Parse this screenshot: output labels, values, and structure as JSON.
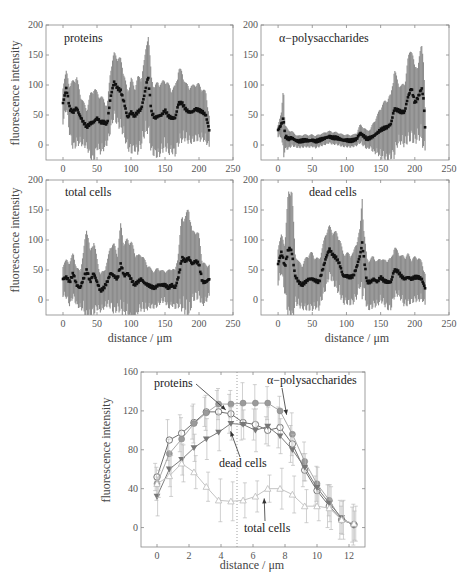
{
  "chart_data": [
    {
      "type": "scatter",
      "panel": "top-left",
      "title": "proteins",
      "xlabel": "",
      "ylabel": "fluorescence intensity",
      "xlim": [
        -25,
        250
      ],
      "ylim": [
        -25,
        200
      ],
      "xticks": [
        0,
        50,
        100,
        150,
        200,
        250
      ],
      "yticks": [
        0,
        50,
        100,
        150,
        200
      ],
      "errorbars": true,
      "x": [
        0,
        5,
        10,
        15,
        20,
        25,
        30,
        35,
        40,
        45,
        50,
        55,
        60,
        65,
        70,
        75,
        80,
        85,
        90,
        95,
        100,
        105,
        110,
        115,
        120,
        125,
        130,
        135,
        140,
        145,
        150,
        155,
        160,
        165,
        170,
        175,
        180,
        185,
        190,
        195,
        200,
        205,
        210,
        215
      ],
      "y": [
        70,
        95,
        60,
        55,
        62,
        48,
        38,
        30,
        36,
        38,
        45,
        38,
        38,
        35,
        80,
        105,
        95,
        90,
        70,
        45,
        55,
        48,
        55,
        60,
        85,
        115,
        55,
        45,
        48,
        50,
        58,
        48,
        45,
        45,
        70,
        70,
        60,
        55,
        55,
        60,
        58,
        55,
        50,
        25
      ],
      "err": [
        30,
        30,
        40,
        55,
        55,
        40,
        35,
        30,
        50,
        60,
        45,
        45,
        40,
        30,
        50,
        50,
        55,
        55,
        50,
        45,
        60,
        50,
        60,
        55,
        60,
        80,
        60,
        55,
        60,
        55,
        55,
        55,
        50,
        55,
        60,
        55,
        45,
        45,
        45,
        45,
        45,
        40,
        40,
        25
      ]
    },
    {
      "type": "scatter",
      "panel": "top-right",
      "title": "α−polysaccharides",
      "xlabel": "",
      "ylabel": "",
      "xlim": [
        -25,
        250
      ],
      "ylim": [
        -25,
        200
      ],
      "xticks": [
        0,
        50,
        100,
        150,
        200,
        250
      ],
      "yticks": [
        0,
        50,
        100,
        150,
        200
      ],
      "errorbars": true,
      "x": [
        0,
        5,
        8,
        10,
        15,
        20,
        25,
        30,
        35,
        40,
        45,
        50,
        55,
        60,
        65,
        70,
        75,
        80,
        85,
        90,
        95,
        100,
        105,
        110,
        115,
        120,
        125,
        130,
        135,
        140,
        145,
        150,
        155,
        160,
        165,
        170,
        175,
        180,
        185,
        190,
        195,
        200,
        205,
        210,
        213,
        215
      ],
      "y": [
        25,
        35,
        45,
        15,
        10,
        12,
        8,
        6,
        7,
        8,
        7,
        8,
        6,
        8,
        10,
        12,
        14,
        12,
        12,
        10,
        8,
        8,
        7,
        8,
        10,
        20,
        15,
        10,
        12,
        15,
        20,
        25,
        28,
        30,
        35,
        60,
        58,
        55,
        55,
        80,
        95,
        70,
        80,
        95,
        75,
        30
      ],
      "err": [
        10,
        20,
        60,
        20,
        15,
        12,
        10,
        10,
        10,
        10,
        10,
        10,
        10,
        10,
        10,
        10,
        10,
        10,
        10,
        10,
        10,
        10,
        10,
        10,
        10,
        15,
        15,
        15,
        15,
        25,
        30,
        40,
        45,
        50,
        50,
        70,
        50,
        45,
        50,
        65,
        75,
        60,
        60,
        75,
        75,
        35
      ]
    },
    {
      "type": "scatter",
      "panel": "middle-left",
      "title": "total cells",
      "xlabel": "distance / μm",
      "ylabel": "fluorescence intensity",
      "xlim": [
        -25,
        250
      ],
      "ylim": [
        -25,
        200
      ],
      "xticks": [
        0,
        50,
        100,
        150,
        200,
        250
      ],
      "yticks": [
        0,
        50,
        100,
        150,
        200
      ],
      "errorbars": true,
      "x": [
        0,
        5,
        10,
        15,
        20,
        25,
        30,
        35,
        40,
        45,
        50,
        55,
        60,
        65,
        70,
        75,
        80,
        85,
        90,
        95,
        100,
        105,
        110,
        115,
        120,
        125,
        130,
        135,
        140,
        145,
        150,
        155,
        160,
        165,
        170,
        175,
        180,
        185,
        190,
        195,
        200,
        205,
        210,
        215
      ],
      "y": [
        35,
        38,
        30,
        45,
        25,
        20,
        35,
        50,
        30,
        45,
        30,
        15,
        20,
        30,
        45,
        40,
        35,
        60,
        40,
        45,
        35,
        25,
        30,
        35,
        28,
        25,
        22,
        20,
        25,
        25,
        25,
        20,
        25,
        20,
        40,
        70,
        65,
        70,
        60,
        65,
        60,
        30,
        30,
        35
      ],
      "err": [
        25,
        30,
        35,
        35,
        30,
        30,
        45,
        80,
        50,
        60,
        40,
        30,
        30,
        35,
        50,
        55,
        45,
        70,
        55,
        60,
        65,
        60,
        45,
        45,
        40,
        35,
        30,
        30,
        30,
        25,
        25,
        30,
        30,
        30,
        45,
        75,
        75,
        90,
        55,
        55,
        50,
        35,
        30,
        25
      ]
    },
    {
      "type": "scatter",
      "panel": "middle-right",
      "title": "dead cells",
      "xlabel": "distance / μm",
      "ylabel": "",
      "xlim": [
        -25,
        250
      ],
      "ylim": [
        -25,
        200
      ],
      "xticks": [
        0,
        50,
        100,
        150,
        200,
        250
      ],
      "yticks": [
        0,
        50,
        100,
        150,
        200
      ],
      "errorbars": true,
      "x": [
        0,
        5,
        10,
        15,
        18,
        20,
        25,
        30,
        35,
        40,
        45,
        50,
        55,
        60,
        65,
        70,
        75,
        80,
        85,
        90,
        95,
        100,
        105,
        110,
        115,
        120,
        123,
        125,
        130,
        135,
        140,
        145,
        150,
        155,
        160,
        165,
        170,
        175,
        180,
        185,
        190,
        195,
        200,
        205,
        210,
        215
      ],
      "y": [
        60,
        80,
        55,
        85,
        85,
        80,
        40,
        30,
        25,
        30,
        35,
        35,
        32,
        30,
        50,
        70,
        85,
        75,
        70,
        60,
        40,
        40,
        38,
        40,
        55,
        75,
        95,
        75,
        30,
        30,
        35,
        30,
        38,
        32,
        30,
        30,
        50,
        48,
        40,
        35,
        38,
        35,
        38,
        38,
        35,
        20
      ],
      "err": [
        30,
        30,
        40,
        100,
        110,
        110,
        40,
        35,
        35,
        40,
        45,
        45,
        40,
        40,
        40,
        45,
        40,
        40,
        45,
        45,
        40,
        40,
        40,
        40,
        45,
        45,
        85,
        50,
        40,
        40,
        40,
        35,
        35,
        35,
        40,
        40,
        40,
        35,
        35,
        40,
        40,
        35,
        35,
        35,
        30,
        25
      ]
    },
    {
      "type": "line",
      "panel": "bottom",
      "title": "",
      "xlabel": "distance / μm",
      "ylabel": "fluorescence intensity",
      "xlim": [
        -1,
        13
      ],
      "ylim": [
        -20,
        160
      ],
      "xticks": [
        0,
        2,
        4,
        6,
        8,
        10,
        12
      ],
      "yticks": [
        0,
        40,
        80,
        120,
        160
      ],
      "vline_dotted_at": 5,
      "x": [
        0,
        0.77,
        1.54,
        2.31,
        3.08,
        3.85,
        4.62,
        5.38,
        6.15,
        6.92,
        7.69,
        8.46,
        9.23,
        10.0,
        10.77,
        11.54,
        12.31
      ],
      "series": [
        {
          "name": "proteins",
          "marker": "circle-open",
          "values": [
            52,
            90,
            97,
            108,
            119,
            119,
            117,
            108,
            106,
            100,
            103,
            86,
            59,
            38,
            22,
            8,
            3
          ]
        },
        {
          "name": "α−polysaccharides",
          "marker": "circle-filled",
          "values": [
            45,
            76,
            91,
            107,
            118,
            127,
            127,
            128,
            128,
            128,
            120,
            96,
            68,
            45,
            28,
            8,
            3
          ]
        },
        {
          "name": "dead cells",
          "marker": "triangle-down",
          "values": [
            32,
            60,
            70,
            82,
            91,
            98,
            107,
            106,
            100,
            104,
            94,
            80,
            62,
            41,
            25,
            10,
            2
          ]
        },
        {
          "name": "total cells",
          "marker": "triangle-up-open",
          "values": [
            45,
            53,
            66,
            57,
            42,
            28,
            27,
            28,
            32,
            40,
            40,
            34,
            22,
            22,
            20,
            8,
            4
          ]
        }
      ],
      "annotations": [
        {
          "text": "proteins",
          "arrow_to": [
            4.3,
            121
          ]
        },
        {
          "text": "α−polysaccharides",
          "arrow_to": [
            8.1,
            116
          ]
        },
        {
          "text": "dead cells",
          "arrow_to": [
            4.6,
            99
          ]
        },
        {
          "text": "total cells",
          "arrow_to": [
            6.7,
            30
          ]
        }
      ]
    }
  ],
  "labels": {
    "ylabel": "fluorescence intensity",
    "xlabel": "distance / μm",
    "p1": "proteins",
    "p2": "α−polysaccharides",
    "p3": "total cells",
    "p4": "dead cells",
    "b_proteins": "proteins",
    "b_poly": "α−polysaccharides",
    "b_dead": "dead cells",
    "b_total": "total cells"
  }
}
